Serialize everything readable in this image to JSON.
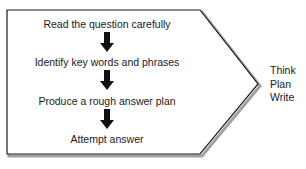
{
  "diagram": {
    "type": "flow-process-pentagon",
    "steps": [
      {
        "label": "Read the question carefully"
      },
      {
        "label": "Identify key words and phrases"
      },
      {
        "label": "Produce a rough answer plan"
      },
      {
        "label": "Attempt answer"
      }
    ],
    "outcome_labels": [
      "Think",
      "Plan",
      "Write"
    ],
    "colors": {
      "outline": "#1a1a1a",
      "shadow": "#9a9a9a",
      "arrow": "#111111",
      "background": "#ffffff",
      "text": "#1a1a1a"
    }
  }
}
